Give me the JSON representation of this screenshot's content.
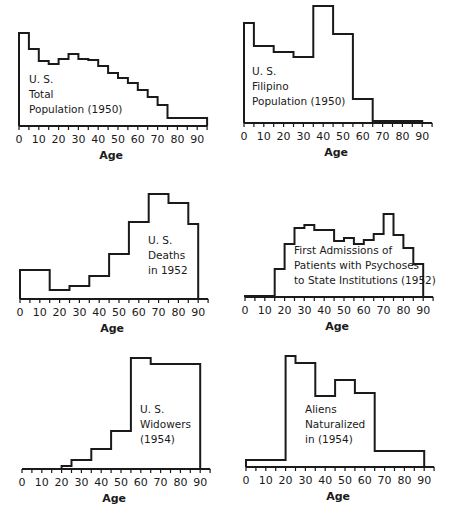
{
  "chart_data": [
    {
      "type": "bar",
      "title": "U. S. Total Population (1950)",
      "label_lines": [
        "U. S.",
        "Total",
        "Population (1950)"
      ],
      "xlabel": "Age",
      "ylabel": "",
      "xticks": [
        0,
        10,
        20,
        30,
        40,
        50,
        60,
        70,
        80,
        90
      ],
      "xlim": [
        0,
        95
      ],
      "bins": [
        [
          0,
          5
        ],
        [
          5,
          10
        ],
        [
          10,
          15
        ],
        [
          15,
          20
        ],
        [
          20,
          25
        ],
        [
          25,
          30
        ],
        [
          30,
          35
        ],
        [
          35,
          40
        ],
        [
          40,
          45
        ],
        [
          45,
          50
        ],
        [
          50,
          55
        ],
        [
          55,
          60
        ],
        [
          60,
          65
        ],
        [
          65,
          70
        ],
        [
          70,
          75
        ],
        [
          75,
          95
        ]
      ],
      "values": [
        93,
        77,
        65,
        62,
        67,
        72,
        67,
        66,
        60,
        53,
        48,
        43,
        36,
        29,
        21,
        8
      ]
    },
    {
      "type": "bar",
      "title": "U. S. Filipino Population (1950)",
      "label_lines": [
        "U. S.",
        "Filipino",
        "Population (1950)"
      ],
      "xlabel": "Age",
      "ylabel": "",
      "xticks": [
        0,
        10,
        20,
        30,
        40,
        50,
        60,
        70,
        80,
        90
      ],
      "xlim": [
        0,
        95
      ],
      "bins": [
        [
          0,
          5
        ],
        [
          5,
          15
        ],
        [
          15,
          25
        ],
        [
          25,
          35
        ],
        [
          35,
          45
        ],
        [
          45,
          55
        ],
        [
          55,
          65
        ],
        [
          65,
          90
        ]
      ],
      "values": [
        100,
        77,
        71,
        66,
        117,
        89,
        24,
        2
      ]
    },
    {
      "type": "bar",
      "title": "U. S. Deaths in 1952",
      "label_lines": [
        "U. S.",
        "Deaths",
        "in 1952"
      ],
      "xlabel": "Age",
      "ylabel": "",
      "xticks": [
        0,
        10,
        20,
        30,
        40,
        50,
        60,
        70,
        80,
        90
      ],
      "xlim": [
        0,
        95
      ],
      "bins": [
        [
          0,
          15
        ],
        [
          15,
          25
        ],
        [
          25,
          35
        ],
        [
          35,
          45
        ],
        [
          45,
          55
        ],
        [
          55,
          65
        ],
        [
          65,
          75
        ],
        [
          75,
          85
        ],
        [
          85,
          90
        ]
      ],
      "values": [
        29,
        9,
        13,
        23,
        45,
        77,
        105,
        96,
        75
      ]
    },
    {
      "type": "bar",
      "title": "First Admissions of Patients with Psychoses to State Institutions (1952)",
      "label_lines": [
        "First Admissions of",
        "Patients with Psychoses",
        "to State Institutions (1952)"
      ],
      "xlabel": "Age",
      "ylabel": "",
      "xticks": [
        0,
        10,
        20,
        30,
        40,
        50,
        60,
        70,
        80,
        90
      ],
      "xlim": [
        0,
        95
      ],
      "bins": [
        [
          0,
          15
        ],
        [
          15,
          20
        ],
        [
          20,
          25
        ],
        [
          25,
          30
        ],
        [
          30,
          35
        ],
        [
          35,
          45
        ],
        [
          45,
          50
        ],
        [
          50,
          55
        ],
        [
          55,
          60
        ],
        [
          60,
          65
        ],
        [
          65,
          70
        ],
        [
          70,
          75
        ],
        [
          75,
          80
        ],
        [
          80,
          85
        ],
        [
          85,
          90
        ]
      ],
      "values": [
        1,
        28,
        53,
        69,
        72,
        67,
        56,
        59,
        53,
        57,
        63,
        83,
        62,
        49,
        33
      ]
    },
    {
      "type": "bar",
      "title": "U. S. Widowers (1954)",
      "label_lines": [
        "U. S.",
        "Widowers",
        "(1954)"
      ],
      "xlabel": "Age",
      "ylabel": "",
      "xticks": [
        0,
        10,
        20,
        30,
        40,
        50,
        60,
        70,
        80,
        90
      ],
      "xlim": [
        0,
        95
      ],
      "bins": [
        [
          0,
          20
        ],
        [
          20,
          25
        ],
        [
          25,
          35
        ],
        [
          35,
          45
        ],
        [
          45,
          55
        ],
        [
          55,
          65
        ],
        [
          65,
          90
        ]
      ],
      "values": [
        0,
        3,
        9,
        20,
        38,
        111,
        105
      ]
    },
    {
      "type": "bar",
      "title": "Aliens Naturalized in (1954)",
      "label_lines": [
        "Aliens",
        "Naturalized",
        "in (1954)"
      ],
      "xlabel": "Age",
      "ylabel": "",
      "xticks": [
        0,
        10,
        20,
        30,
        40,
        50,
        60,
        70,
        80,
        90
      ],
      "xlim": [
        0,
        95
      ],
      "bins": [
        [
          0,
          20
        ],
        [
          20,
          25
        ],
        [
          25,
          35
        ],
        [
          35,
          45
        ],
        [
          45,
          55
        ],
        [
          55,
          65
        ],
        [
          65,
          90
        ]
      ],
      "values": [
        7,
        111,
        104,
        71,
        87,
        74,
        16
      ]
    }
  ],
  "layout": {
    "panels": [
      {
        "left": 0,
        "top": 0,
        "x0": 19,
        "baseline": 126,
        "label_x": 29,
        "label_y": 72
      },
      {
        "left": 225,
        "top": 0,
        "x0": 19,
        "baseline": 123,
        "label_x": 27,
        "label_y": 64
      },
      {
        "left": 0,
        "top": 180,
        "x0": 20,
        "baseline": 119,
        "label_x": 148,
        "label_y": 53
      },
      {
        "left": 225,
        "top": 180,
        "x0": 20,
        "baseline": 117,
        "label_x": 69,
        "label_y": 63
      },
      {
        "left": 0,
        "top": 350,
        "x0": 22,
        "baseline": 119,
        "label_x": 140,
        "label_y": 52
      },
      {
        "left": 225,
        "top": 350,
        "x0": 21,
        "baseline": 117,
        "label_x": 80,
        "label_y": 52
      }
    ],
    "px_per_year": 1.98,
    "line_color": "#1a1a1a"
  }
}
